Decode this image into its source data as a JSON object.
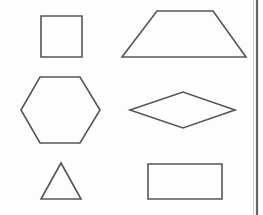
{
  "page": {
    "background_color": "#fefefe",
    "stroke_color": "#555555",
    "stroke_width": 1.6,
    "width": 263,
    "height": 215,
    "page_edge": {
      "name": "right-page-edge",
      "color": "#4a4a4a",
      "x": 257,
      "y_start": 0,
      "y_end": 215
    }
  },
  "shapes": [
    {
      "id": "square",
      "label": "Square",
      "type": "polygon",
      "sides": 4,
      "row": 1,
      "column": 1,
      "points": "41,16 82,16 82,57 41,57",
      "bounds": {
        "x": 41,
        "y": 16,
        "width": 41,
        "height": 41
      }
    },
    {
      "id": "trapezoid",
      "label": "Trapezoid",
      "type": "polygon",
      "sides": 4,
      "row": 1,
      "column": 2,
      "points": "157,11 213,11 246,57 122,57",
      "bounds": {
        "x": 122,
        "y": 11,
        "width": 124,
        "height": 46
      }
    },
    {
      "id": "hexagon",
      "label": "Hexagon",
      "type": "polygon",
      "sides": 6,
      "row": 2,
      "column": 1,
      "points": "40,77 80,77 100,110 80,143 40,143 21,110",
      "bounds": {
        "x": 21,
        "y": 77,
        "width": 79,
        "height": 66
      }
    },
    {
      "id": "rhombus",
      "label": "Rhombus",
      "type": "polygon",
      "sides": 4,
      "row": 2,
      "column": 2,
      "points": "130,110 183,92 235,110 183,128",
      "bounds": {
        "x": 130,
        "y": 92,
        "width": 105,
        "height": 36
      }
    },
    {
      "id": "triangle",
      "label": "Triangle",
      "type": "polygon",
      "sides": 3,
      "row": 3,
      "column": 1,
      "points": "61,163 81,199 41,199",
      "bounds": {
        "x": 41,
        "y": 163,
        "width": 40,
        "height": 36
      }
    },
    {
      "id": "rectangle",
      "label": "Rectangle",
      "type": "polygon",
      "sides": 4,
      "row": 3,
      "column": 2,
      "points": "148,164 222,164 222,199 148,199",
      "bounds": {
        "x": 148,
        "y": 164,
        "width": 74,
        "height": 35
      }
    }
  ]
}
